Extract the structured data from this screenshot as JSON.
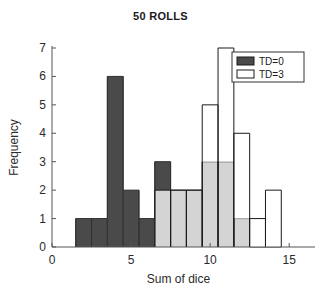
{
  "chart_data": {
    "type": "bar",
    "title": "50 ROLLS",
    "xlabel": "Sum of dice",
    "ylabel": "Frequency",
    "xlim": [
      0,
      16
    ],
    "ylim": [
      0,
      7
    ],
    "xticks": [
      0,
      5,
      10,
      15
    ],
    "yticks": [
      0,
      1,
      2,
      3,
      4,
      5,
      6,
      7
    ],
    "grid": false,
    "legend_position": "top-right",
    "bin_width": 1,
    "categories": [
      2,
      3,
      4,
      5,
      6,
      7,
      8,
      9,
      10,
      11,
      12,
      13,
      14
    ],
    "series": [
      {
        "name": "TD=0",
        "color": "#4a4a4a",
        "style": "filled",
        "values": [
          1,
          1,
          6,
          2,
          1,
          3,
          2,
          2,
          3,
          3,
          1,
          0,
          0
        ]
      },
      {
        "name": "TD=3",
        "color": "#ffffff",
        "style": "outline",
        "values": [
          0,
          0,
          0,
          0,
          0,
          2,
          2,
          2,
          5,
          7,
          4,
          1,
          2
        ]
      }
    ],
    "overlap_color": "#d4d4d4",
    "outline_color": "#1a1a1a"
  },
  "legend": {
    "entries": [
      {
        "label": "TD=0",
        "swatch": "#4a4a4a"
      },
      {
        "label": "TD=3",
        "swatch": "#ffffff"
      }
    ]
  },
  "axis": {
    "x_tick_labels": [
      "0",
      "5",
      "10",
      "15"
    ],
    "y_tick_labels": [
      "0",
      "1",
      "2",
      "3",
      "4",
      "5",
      "6",
      "7"
    ]
  }
}
